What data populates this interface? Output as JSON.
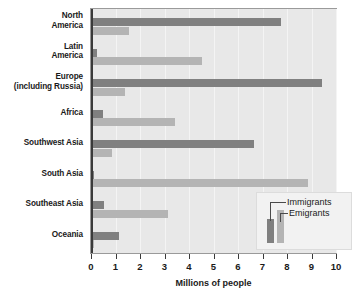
{
  "chart_data": {
    "type": "bar",
    "orientation": "horizontal",
    "title": "",
    "xlabel": "Millions of people",
    "ylabel": "",
    "xlim": [
      0,
      10
    ],
    "xticks": [
      0,
      1,
      2,
      3,
      4,
      5,
      6,
      7,
      8,
      9,
      10
    ],
    "xticklabels": [
      "0",
      "1",
      "2",
      "3",
      "4",
      "5",
      "6",
      "7",
      "8",
      "9",
      "10"
    ],
    "grid": true,
    "grid_axis": "x",
    "legend_position": "lower right",
    "categories": [
      "North\nAmerica",
      "Latin\nAmerica",
      "Europe\n(including Russia)",
      "Africa",
      "Southwest Asia",
      "South Asia",
      "Southeast Asia",
      "Oceania"
    ],
    "series": [
      {
        "name": "Immigrants",
        "color": "#808080",
        "values": [
          7.7,
          0.2,
          9.4,
          0.45,
          6.6,
          0.1,
          0.5,
          1.1
        ]
      },
      {
        "name": "Emigrants",
        "color": "#b4b4b4",
        "values": [
          1.5,
          4.5,
          1.35,
          3.4,
          0.8,
          8.8,
          3.1,
          0.1
        ]
      }
    ]
  },
  "axis": {
    "x_title": "Millions of people"
  },
  "legend": {
    "immigrants_label": "Immigrants",
    "emigrants_label": "Emigrants"
  },
  "colors": {
    "immigrants": "#808080",
    "emigrants": "#b4b4b4",
    "plot_background": "#e8e8e8",
    "gridline": "#f4f4f4",
    "axis": "#3a3a3a",
    "text": "#1a1a1a"
  }
}
